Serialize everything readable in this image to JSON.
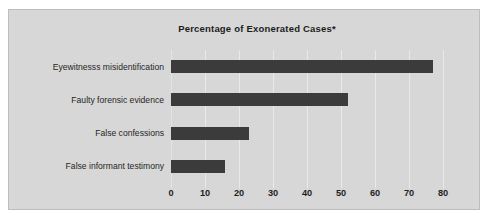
{
  "chart": {
    "title": "Percentage of Exonerated Cases*",
    "panel_color": "#d7d7d7",
    "bar_color": "#3b3b3b",
    "grid_color": "#e9e9e9"
  },
  "chart_data": {
    "type": "bar",
    "orientation": "horizontal",
    "title": "Percentage of Exonerated Cases*",
    "xlabel": "",
    "ylabel": "",
    "categories": [
      "Eyewitnesss misidentification",
      "Faulty forensic evidence",
      "False confessions",
      "False informant testimony"
    ],
    "values": [
      77,
      52,
      23,
      16
    ],
    "xlim": [
      0,
      80
    ],
    "xticks": [
      0,
      10,
      20,
      30,
      40,
      50,
      60,
      70,
      80
    ],
    "xticklabels": [
      "0",
      "10",
      "20",
      "30",
      "40",
      "50",
      "60",
      "70",
      "80"
    ],
    "grid": "vertical",
    "legend": "none",
    "series": [
      {
        "name": "Percentage of Exonerated Cases",
        "values": [
          77,
          52,
          23,
          16
        ]
      }
    ]
  }
}
